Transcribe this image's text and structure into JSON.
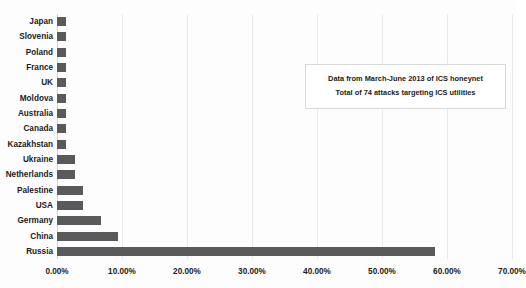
{
  "chart_data": {
    "type": "bar",
    "orientation": "horizontal",
    "title": "",
    "xlabel": "",
    "ylabel": "",
    "xlim": [
      0,
      70
    ],
    "xtick_labels": [
      "0.00%",
      "10.00%",
      "20.00%",
      "30.00%",
      "40.00%",
      "50.00%",
      "60.00%",
      "70.00%"
    ],
    "xtick_values": [
      0,
      10,
      20,
      30,
      40,
      50,
      60,
      70
    ],
    "grid": "vertical",
    "legend": "none",
    "categories": [
      "Japan",
      "Slovenia",
      "Poland",
      "France",
      "UK",
      "Moldova",
      "Australia",
      "Canada",
      "Kazakhstan",
      "Ukraine",
      "Netherlands",
      "Palestine",
      "USA",
      "Germany",
      "China",
      "Russia"
    ],
    "values": [
      1.35,
      1.35,
      1.35,
      1.35,
      1.35,
      1.35,
      1.35,
      1.35,
      1.35,
      2.7,
      2.7,
      4.05,
      4.05,
      6.76,
      9.46,
      58.1
    ],
    "value_labels": [
      "1.35%",
      "1.35%",
      "1.35%",
      "1.35%",
      "1.35%",
      "1.35%",
      "1.35%",
      "1.35%",
      "1.35%",
      "2.70%",
      "2.70%",
      "4.05%",
      "4.05%",
      "6.76%",
      "9.46%",
      "58.10%"
    ],
    "bar_color": "#5a5a5c",
    "gridline_color": "#e9e9e9",
    "annotations": [
      "Data from March-June 2013 of ICS honeynet",
      "Total of 74 attacks targeting ICS utilities"
    ]
  }
}
